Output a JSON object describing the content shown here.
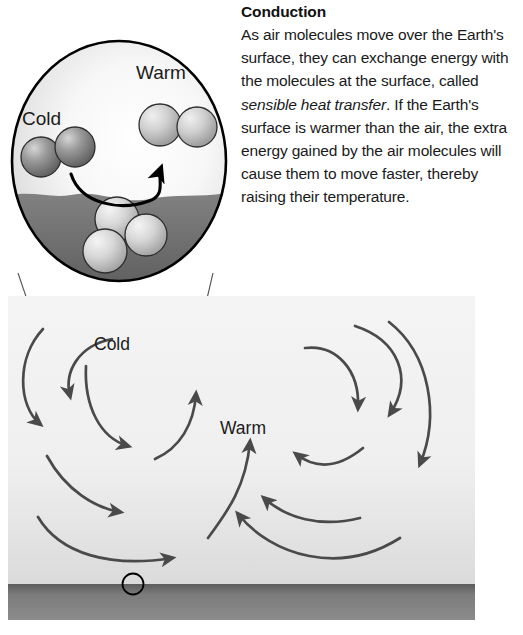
{
  "figure": {
    "width": 523,
    "height": 635,
    "background_color": "#ffffff"
  },
  "caption": {
    "title": "Conduction",
    "paragraph_plain": "As air molecules move over the Earth's surface, they can exchange energy with the molecules at the surface, called sensible heat transfer. If the Earth's surface is warmer than the air, the extra energy gained by the air molecules will cause them to move faster, thereby raising their temperature.",
    "segment_1": "As air molecules move over the Earth's surface, they can exchange energy with the molecules at the surface, called ",
    "segment_italic": "sensible heat transfer",
    "segment_2": ". If the Earth's surface is warmer than the air, the extra energy gained by the air molecules will cause them to move faster, thereby raising their temperature."
  },
  "inset": {
    "label_cold": "Cold",
    "label_warm": "Warm",
    "cold_molecule_count": 2,
    "warm_molecule_count": 2,
    "surface_molecule_count": 3,
    "border_color": "#000000",
    "sky_color": "#f2f2f2",
    "ground_color": "#6f6f6f",
    "molecule_cold_color": "#8c8c8c",
    "molecule_warm_color": "#c9c9c9",
    "molecule_surface_color": "#d2d2d2",
    "arrow_color": "#000000",
    "arrow_description": "curved arrow from cold molecules across the surface up to the warm molecules"
  },
  "scene": {
    "label_cold": "Cold",
    "label_warm": "Warm",
    "ground_color": "#7a7a7a",
    "sky_color": "#f0f0f0",
    "arrow_color": "#4a4a4a",
    "focus_circle_color": "#000000",
    "left_cell_rotation": "clockwise",
    "right_cell_rotation": "clockwise",
    "left_cell_arrow_count": 5,
    "right_cell_arrow_count": 6,
    "updraft_arrow_count": 1
  },
  "cone": {
    "line_color": "#555555",
    "description": "two thin leader lines from the magnifier circle down to the focus point on the ground"
  }
}
